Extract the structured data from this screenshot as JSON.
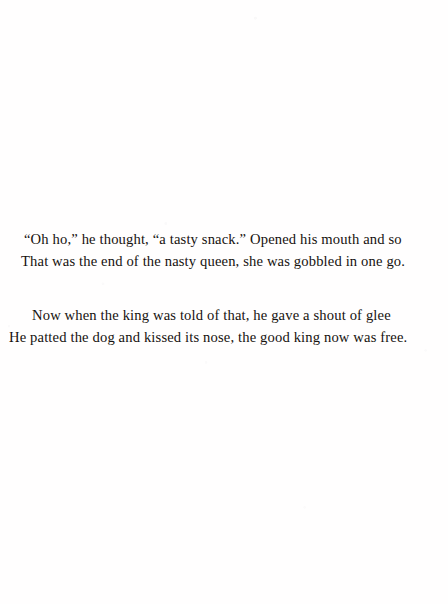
{
  "page": {
    "kind": "scanned-book-page",
    "background_color": "#ffffff",
    "text_color": "#16120f"
  },
  "poem": {
    "stanzas": [
      {
        "lines": [
          "“Oh ho,” he thought, “a tasty snack.” Opened his mouth and so",
          "That was the end of the nasty queen, she was gobbled in one go."
        ]
      },
      {
        "lines": [
          "Now when the king was told of that, he gave a shout of glee",
          "He patted the dog and kissed its nose, the good king now was free."
        ]
      }
    ]
  }
}
